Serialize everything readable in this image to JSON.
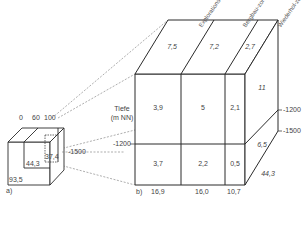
{
  "small_cube": {
    "label": "a)",
    "top_ticks": [
      "0",
      "60",
      "100"
    ],
    "values": {
      "front_lower_left": "93,5",
      "front_middle": "44,3",
      "inner_right": "37,4"
    },
    "depth_label": "-1500"
  },
  "large_cube": {
    "label": "b)",
    "axis_label_line1": "Tiefe",
    "axis_label_line2": "(m NN)",
    "zone_headers": [
      "Explorations-zone",
      "Bergbau-zone",
      "Wiederhol-zone"
    ],
    "top_values": [
      "7,5",
      "7,2",
      "2,7"
    ],
    "upper_row_values": [
      "3,9",
      "5",
      "2,1"
    ],
    "lower_row_values": [
      "3,7",
      "2,2",
      "0,5"
    ],
    "bottom_totals": [
      "16,9",
      "16,0",
      "10,7"
    ],
    "side_values": {
      "upper": "11",
      "lower": "6,5",
      "bottom_edge": "44,3"
    },
    "depth_left": "-1200",
    "depth_left_lower": "-1500",
    "depth_right_upper": "-1200",
    "depth_right_lower": "-1500"
  },
  "colors": {
    "line": "#2a2a2a",
    "dashed": "#666666",
    "text": "#444444"
  }
}
